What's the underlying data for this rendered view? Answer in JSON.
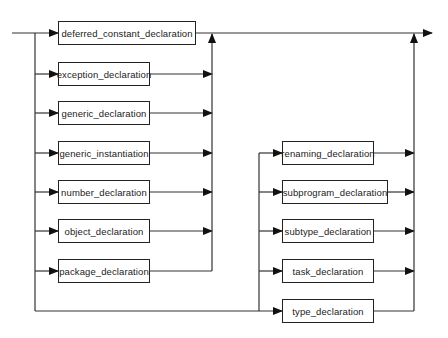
{
  "diagram": {
    "type": "syntax-railroad",
    "colors": {
      "line": "#333333",
      "box_border": "#222222",
      "text": "#222222",
      "background": "#ffffff"
    },
    "left_column": [
      {
        "id": "deferred",
        "label": "deferred_constant_declaration"
      },
      {
        "id": "exception",
        "label": "exception_declaration"
      },
      {
        "id": "generic",
        "label": "generic_declaration"
      },
      {
        "id": "generic_inst",
        "label": "generic_instantiation"
      },
      {
        "id": "number",
        "label": "number_declaration"
      },
      {
        "id": "object",
        "label": "object_declaration"
      },
      {
        "id": "package",
        "label": "package_declaration"
      }
    ],
    "right_column": [
      {
        "id": "renaming",
        "label": "renaming_declaration"
      },
      {
        "id": "subprogram",
        "label": "subprogram_declaration"
      },
      {
        "id": "subtype",
        "label": "subtype_declaration"
      },
      {
        "id": "task",
        "label": "task_declaration"
      },
      {
        "id": "type",
        "label": "type_declaration"
      }
    ]
  }
}
